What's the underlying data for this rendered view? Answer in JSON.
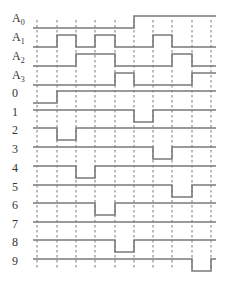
{
  "colors": {
    "signal": "#7a7a7a",
    "grid": "#555555",
    "label": "#333333",
    "background": "#ffffff"
  },
  "inputs": [
    {
      "name": "A",
      "sub": "0",
      "pattern": [
        0,
        0,
        0,
        0,
        0,
        1,
        1,
        1,
        1,
        1
      ]
    },
    {
      "name": "A",
      "sub": "1",
      "pattern": [
        0,
        1,
        0,
        1,
        0,
        0,
        1,
        0,
        0,
        0
      ]
    },
    {
      "name": "A",
      "sub": "2",
      "pattern": [
        0,
        0,
        1,
        1,
        0,
        0,
        0,
        1,
        0,
        0
      ]
    },
    {
      "name": "A",
      "sub": "3",
      "pattern": [
        0,
        0,
        0,
        0,
        1,
        0,
        0,
        0,
        1,
        1
      ]
    }
  ],
  "outputs": [
    {
      "label": "0",
      "low_slot": 0
    },
    {
      "label": "1",
      "low_slot": 5
    },
    {
      "label": "2",
      "low_slot": 1
    },
    {
      "label": "3",
      "low_slot": 6
    },
    {
      "label": "4",
      "low_slot": 2
    },
    {
      "label": "5",
      "low_slot": 7
    },
    {
      "label": "6",
      "low_slot": 3
    },
    {
      "label": "7",
      "low_slot": -1
    },
    {
      "label": "8",
      "low_slot": 4
    },
    {
      "label": "9",
      "low_slot": 8
    }
  ],
  "layout": {
    "x_start": 33,
    "slot_edges": [
      33,
      57,
      76,
      95,
      115,
      134,
      153,
      172,
      192,
      211,
      216
    ],
    "dash_x": [
      37,
      57,
      76,
      95,
      115,
      134,
      153,
      172,
      192,
      211
    ],
    "input_low_y": [
      28,
      47,
      66,
      85
    ],
    "output_high_y": [
      91,
      110,
      128,
      147,
      166,
      185,
      203,
      222,
      240,
      259
    ],
    "swing": 12
  }
}
